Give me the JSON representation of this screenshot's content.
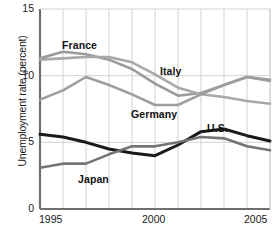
{
  "chart_data": {
    "type": "line",
    "title": "",
    "subtitle": "",
    "xlabel": "",
    "ylabel": "Unemployment rate (percent)",
    "xlim": [
      1995,
      2005
    ],
    "ylim": [
      0,
      15
    ],
    "yticks": [
      0,
      5,
      10,
      15
    ],
    "ytick_labels": [
      "0",
      "5",
      "10",
      "15"
    ],
    "xticks": [
      1995,
      2000,
      2005
    ],
    "xtick_labels": [
      "1995",
      "2000",
      "2005"
    ],
    "grid": "both",
    "legend": "inline-annotations",
    "x": [
      1995,
      1996,
      1997,
      1998,
      1999,
      2000,
      2001,
      2002,
      2003,
      2004,
      2005
    ],
    "series": [
      {
        "name": "France",
        "color": "#9a9a9a",
        "width": 2.6,
        "values": [
          11.3,
          11.8,
          11.6,
          11.2,
          10.5,
          9.4,
          8.5,
          8.7,
          9.3,
          9.9,
          9.7
        ],
        "label": "France",
        "label_x": 62,
        "label_y": 39
      },
      {
        "name": "Italy",
        "color": "#a8a8a8",
        "width": 2.6,
        "values": [
          11.2,
          11.3,
          11.4,
          11.4,
          11.0,
          10.1,
          9.1,
          8.6,
          8.4,
          8.1,
          7.9
        ],
        "label": "Italy",
        "label_x": 160,
        "label_y": 65
      },
      {
        "name": "Germany",
        "color": "#9e9e9e",
        "width": 2.6,
        "values": [
          8.2,
          8.9,
          9.9,
          9.3,
          8.6,
          7.8,
          7.8,
          8.6,
          9.3,
          9.9,
          9.6
        ],
        "label": "Germany",
        "label_x": 131,
        "label_y": 108
      },
      {
        "name": "U.S.",
        "color": "#1a1a1a",
        "width": 3.0,
        "values": [
          5.6,
          5.4,
          5.0,
          4.5,
          4.2,
          4.0,
          4.8,
          5.8,
          6.0,
          5.5,
          5.1
        ],
        "label": "U.S.",
        "label_x": 207,
        "label_y": 122
      },
      {
        "name": "Japan",
        "color": "#747474",
        "width": 2.6,
        "values": [
          3.1,
          3.4,
          3.4,
          4.1,
          4.7,
          4.7,
          5.0,
          5.4,
          5.3,
          4.7,
          4.4
        ],
        "label": "Japan",
        "label_x": 78,
        "label_y": 173
      }
    ]
  }
}
